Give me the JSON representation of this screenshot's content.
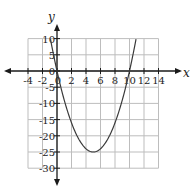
{
  "chart_data": {
    "type": "line",
    "title": "",
    "xlabel": "x",
    "ylabel": "y",
    "xlim": [
      -4,
      14
    ],
    "ylim": [
      -30,
      10
    ],
    "grid": true,
    "x_ticks": [
      -4,
      -2,
      0,
      2,
      4,
      6,
      8,
      10,
      12,
      14
    ],
    "y_ticks": [
      -30,
      -25,
      -20,
      -15,
      -10,
      -5,
      0,
      5,
      10
    ],
    "x_tick_labels": [
      "-4",
      "-2",
      "0",
      "2",
      "4",
      "6",
      "8",
      "10",
      "12",
      "14"
    ],
    "y_tick_labels": [
      "-30",
      "-25",
      "-20",
      "-15",
      "-10",
      "-5",
      "0",
      "5",
      "10"
    ],
    "series": [
      {
        "name": "y = x^2 - 10x",
        "function": "x*x - 10*x",
        "x": [
          -0.9,
          0,
          1,
          2,
          3,
          4,
          5,
          6,
          7,
          8,
          9,
          10,
          10.9
        ],
        "values": [
          9.8,
          0,
          -9,
          -16,
          -21,
          -24,
          -25,
          -24,
          -21,
          -16,
          -9,
          0,
          9.8
        ]
      }
    ],
    "annotations": {
      "vertex": [
        5,
        -25
      ],
      "roots": [
        0,
        10
      ]
    }
  },
  "colors": {
    "grid": "#bdbdbd",
    "axis": "#1a1a1a",
    "curve": "#3a3a3a",
    "text": "#222222"
  }
}
